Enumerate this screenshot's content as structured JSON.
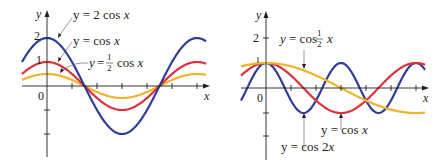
{
  "colors": {
    "blue": "#2e3d9a",
    "red": "#e0303a",
    "yellow": "#f0b429",
    "axis": "#231f20",
    "pointer": "#6d6e71"
  },
  "chart_data": [
    {
      "type": "line",
      "title": "Left graph: vertical stretching of cos x",
      "xlabel": "x",
      "ylabel": "y",
      "y_tick_labels": [
        "2",
        "1",
        "0"
      ],
      "grid": false,
      "xlim": [
        -1.9,
        7.4
      ],
      "ylim": [
        -2.9,
        2.4
      ],
      "series": [
        {
          "name": "y = 2 cos x",
          "formula": "2*cos(x)",
          "color": "#2e3d9a",
          "amplitude": 2
        },
        {
          "name": "y = cos x",
          "formula": "cos(x)",
          "color": "#e0303a",
          "amplitude": 1
        },
        {
          "name": "y = 1/2 cos x",
          "formula": "0.5*cos(x)",
          "color": "#f0b429",
          "amplitude": 0.5
        }
      ],
      "labels": {
        "two_cos": {
          "prefix": "y = 2 cos ",
          "var": "x"
        },
        "cos": {
          "prefix": "y = cos ",
          "var": "x"
        },
        "half_cos": {
          "prefix": "y = ",
          "num": "1",
          "den": "2",
          "suffix": " cos ",
          "var": "x"
        }
      }
    },
    {
      "type": "line",
      "title": "Right graph: horizontal stretching/compression of cos x",
      "xlabel": "x",
      "ylabel": "y",
      "y_tick_labels": [
        "2",
        "1",
        "0"
      ],
      "grid": false,
      "xlim": [
        -1.9,
        7.4
      ],
      "ylim": [
        -2.8,
        2.4
      ],
      "series": [
        {
          "name": "y = cos 1/2 x",
          "formula": "cos(0.5*x)",
          "color": "#f0b429",
          "period": "4π"
        },
        {
          "name": "y = cos x",
          "formula": "cos(x)",
          "color": "#e0303a",
          "period": "2π"
        },
        {
          "name": "y = cos 2x",
          "formula": "cos(2*x)",
          "color": "#2e3d9a",
          "period": "π"
        }
      ],
      "labels": {
        "cos_half": {
          "prefix": "y = cos ",
          "num": "1",
          "den": "2",
          "var": "x"
        },
        "cos": {
          "prefix": "y = cos ",
          "var": "x"
        },
        "cos_two": {
          "prefix": "y = cos 2",
          "var": "x"
        }
      }
    }
  ]
}
